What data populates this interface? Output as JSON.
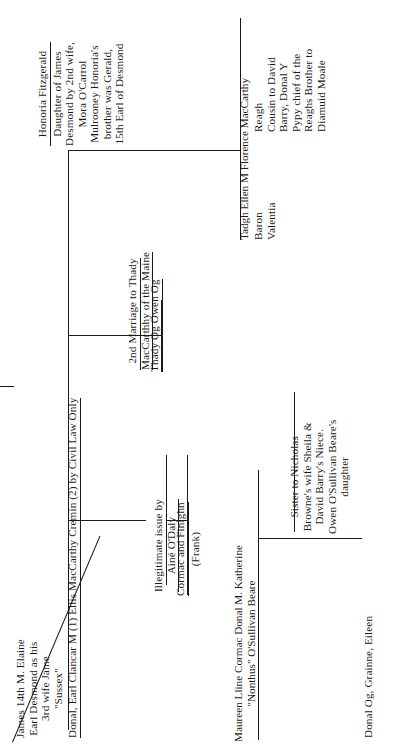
{
  "document": {
    "title": "MacCarthy Mor genealogical descent chart",
    "orientation": "rotated-90-counterclockwise",
    "page_background": "#ffffff",
    "ink_color": "#1a1a1a"
  },
  "nodes": {
    "james_desmond": {
      "name": "james-14th-elaine",
      "lines": [
        "James 14th M. Elaine",
        "Earl Desmond as his",
        "3rd wife Jame",
        "\"Sussex\""
      ],
      "underlined": false
    },
    "donal_earl_clancar": {
      "name": "donal-earl-clancar",
      "lines": [
        "Donal, Earl Clancar M (1) Ellis MacCarthy Cremin (2) by Civil Law Only"
      ],
      "underlined": true
    },
    "honoria_fitzgerald": {
      "name": "honoria-fitzgerald",
      "heading": "Honoria Fitzgerald",
      "lines": [
        "Daughter of James",
        "Desmond by 2nd wife,",
        "Mora O'Carrol",
        "Mulrooney Honoria's",
        "brother was Gerald,",
        "15th Earl of Desmond"
      ],
      "underlined": true
    },
    "second_marriage": {
      "name": "second-marriage-thady",
      "lines": [
        "2nd Marriage to Thady",
        "MacCarthhy of the Maine"
      ],
      "underlined": true
    },
    "thady_owen": {
      "name": "thady-og-owen-og",
      "lines": [
        "Thady Og   Owen Og"
      ],
      "underlined": true
    },
    "illegitimate_issue": {
      "name": "illegitimate-issue-aine-odaly",
      "lines": [
        "Illegitimate issue by",
        "Ainé O'Daly"
      ],
      "underlined": true
    },
    "cormac_finighn": {
      "name": "cormac-and-finighn",
      "lines": [
        "Cormac and Finighn",
        "(Frank)"
      ],
      "underlined": true
    },
    "florence_maccarthy": {
      "name": "florence-maccarthy-reagh",
      "siblings": "Tadgh   Ellen   M  Florence MacCarthy",
      "lines": [
        "Reagh",
        "Cousin to David",
        "Barry, Donal Y",
        "Pypy chief of the",
        "Reaghs Brother to",
        "Diamuid Moale"
      ],
      "titles": [
        "Baron",
        "Valentia"
      ],
      "underlined": false
    },
    "children_row": {
      "name": "children-maureen-lline-cormac-donal",
      "lines": [
        "Maureen   Lline   Cormac   Donal   M.   Katherine",
        "\"Nonthus\"   O'Sullivan Beare"
      ],
      "underlined": false
    },
    "katherine_detail": {
      "name": "katherine-osullivan-beare-detail",
      "heading": "O'Sullivan Beare",
      "lines": [
        "Sister to Nicholas",
        "Browne's wife Sheila &",
        "David Barry's Niece.",
        "Owen O'Sullivan Beare's",
        "daughter"
      ],
      "underlined": true
    },
    "grandchildren": {
      "name": "donal-og-grainne-eileen",
      "lines": [
        "Donal Og, Grainne, Eileen"
      ],
      "underlined": false
    }
  }
}
